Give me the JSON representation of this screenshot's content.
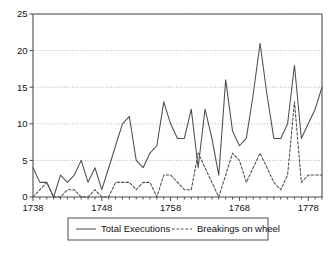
{
  "chart_data": {
    "type": "line",
    "title": "",
    "subtitle": "",
    "xlabel": "",
    "ylabel": "",
    "xlim": [
      1738,
      1780
    ],
    "ylim": [
      0,
      25
    ],
    "yticks": [
      0,
      5,
      10,
      15,
      20,
      25
    ],
    "ytick_labels": [
      "0",
      "5",
      "10",
      "15",
      "20",
      "25"
    ],
    "xticks": [
      1738,
      1748,
      1758,
      1768,
      1778
    ],
    "xtick_labels": [
      "1738",
      "1748",
      "1758",
      "1768",
      "1778"
    ],
    "x_minor_tick_step": 1,
    "grid": "horizontal-dotted",
    "legend_position": "bottom-center",
    "x": [
      1738,
      1739,
      1740,
      1741,
      1742,
      1743,
      1744,
      1745,
      1746,
      1747,
      1748,
      1749,
      1750,
      1751,
      1752,
      1753,
      1754,
      1755,
      1756,
      1757,
      1758,
      1759,
      1760,
      1761,
      1762,
      1763,
      1764,
      1765,
      1766,
      1767,
      1768,
      1769,
      1770,
      1771,
      1772,
      1773,
      1774,
      1775,
      1776,
      1777,
      1778,
      1779,
      1780
    ],
    "series": [
      {
        "name": "Total Executions",
        "style": "solid",
        "color": "#4d4d4d",
        "values": [
          4,
          2,
          2,
          0,
          3,
          2,
          3,
          5,
          2,
          4,
          1,
          4,
          7,
          10,
          11,
          5,
          4,
          6,
          7,
          13,
          10,
          8,
          8,
          12,
          4,
          12,
          8,
          3,
          16,
          9,
          7,
          8,
          14,
          21,
          14,
          8,
          8,
          10,
          18,
          8,
          10,
          12,
          15
        ]
      },
      {
        "name": "Breakings on wheel",
        "style": "dashed",
        "color": "#4d4d4d",
        "values": [
          0,
          1,
          2,
          0,
          0,
          1,
          1,
          0,
          0,
          1,
          0,
          0,
          2,
          2,
          2,
          1,
          2,
          2,
          0,
          3,
          3,
          2,
          1,
          1,
          6,
          4,
          2,
          0,
          3,
          6,
          5,
          2,
          4,
          6,
          4,
          2,
          1,
          3,
          13,
          2,
          3,
          3,
          3
        ]
      }
    ]
  },
  "legend": {
    "items": [
      {
        "label": "Total Executions",
        "style": "solid"
      },
      {
        "label": "Breakings on wheel",
        "style": "dashed"
      }
    ]
  },
  "colors": {
    "axis": "#4d4d4d",
    "grid": "#9a9a9a",
    "line": "#4d4d4d",
    "text": "#111111",
    "background": "#ffffff"
  }
}
